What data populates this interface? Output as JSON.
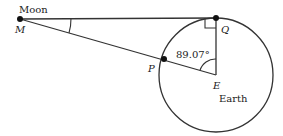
{
  "diagram": {
    "points": {
      "M": {
        "label": "M",
        "x": 20,
        "y": 19
      },
      "Q": {
        "label": "Q",
        "x": 216,
        "y": 18
      },
      "E": {
        "label": "E",
        "x": 216,
        "y": 75
      },
      "P": {
        "label": "P",
        "x": 164,
        "y": 59
      }
    },
    "labels": {
      "moon": "Moon",
      "earth": "Earth",
      "angle_E": "89.07°"
    },
    "circle": {
      "cx": 216,
      "cy": 75,
      "r": 57
    },
    "colors": {
      "stroke": "#333333",
      "text": "#222222"
    }
  }
}
